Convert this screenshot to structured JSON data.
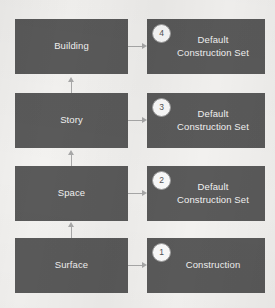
{
  "diagram": {
    "background_color": "#f3f2f0",
    "node_color": "#5a5a5a",
    "node_text_color": "#f2f2f2",
    "connector_color": "#a9a9a9",
    "badge_fill_color": "#fbfbfb",
    "badge_text_color": "#545454",
    "entities": [
      {
        "label": "Building",
        "row": 1
      },
      {
        "label": "Story",
        "row": 2
      },
      {
        "label": "Space",
        "row": 3
      },
      {
        "label": "Surface",
        "row": 4
      }
    ],
    "constructions": [
      {
        "badge": "4",
        "label": "Default\nConstruction Set",
        "row": 1
      },
      {
        "badge": "3",
        "label": "Default\nConstruction Set",
        "row": 2
      },
      {
        "badge": "2",
        "label": "Default\nConstruction Set",
        "row": 3
      },
      {
        "badge": "1",
        "label": "Construction",
        "row": 4
      }
    ]
  }
}
